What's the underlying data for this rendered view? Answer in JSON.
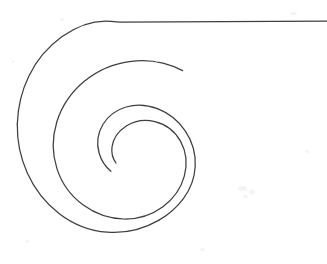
{
  "document": {
    "title": "Spiral Drawing",
    "medium": "scanned line drawing",
    "background_color": "#ffffff",
    "ink_color": "#3f3f42",
    "stroke_width": 1.25,
    "width": 327,
    "height": 264
  },
  "figure": {
    "name": "spiral-with-tangent-tail",
    "shape_type": "spiral",
    "turns": 1.55,
    "winding": "counterclockwise-inward",
    "pole": {
      "x": 147,
      "y": 140
    },
    "inner_terminus": {
      "x": 116,
      "y": 163
    },
    "outer_terminus": {
      "x": 327,
      "y": 21
    },
    "bounds": {
      "left": 17,
      "right": 327,
      "top": 21,
      "bottom": 246
    },
    "extremes": {
      "leftmost": {
        "x": 17,
        "y": 125
      },
      "bottommost": {
        "x": 105,
        "y": 246
      },
      "rightmost_whorl": {
        "x": 190,
        "y": 175
      },
      "inner_apex": {
        "x": 140,
        "y": 108
      }
    },
    "tail": {
      "name": "horizontal-tail",
      "description": "spiral unwinds into a near-horizontal straight line toward the right edge",
      "flatten_point": {
        "x": 120,
        "y": 22
      },
      "end_point": {
        "x": 327,
        "y": 21
      }
    },
    "spiral_path": "M 116.0 163.0 C 112.6 158.3 111.2 152.8 112.0 147.0 C 113.2 138.4 118.6 130.9 126.3 126.0 C 134.6 120.7 145.1 119.2 154.9 121.6 C 165.8 124.3 175.2 131.6 180.6 141.4 C 186.4 151.9 187.4 164.6 184.3 176.1 C 181.0 188.5 173.0 199.3 162.6 206.9 C 151.5 215.0 137.8 219.2 124.0 219.0 C 109.4 218.8 95.0 213.7 83.3 205.1 C 71.0 196.1 61.7 183.3 57.0 168.9 C 52.1 153.8 52.1 137.2 56.8 122.0 C 61.7 106.2 71.5 91.9 84.3 81.3 C 97.6 70.3 114.1 63.3 131.2 61.3 C 148.8 59.2 166.9 62.4 182.6 70.6",
    "spiral_path_outer": "M 182.6 70.6 C 166.9 62.4 148.8 59.2 131.2 61.3 C 114.1 63.3 97.6 70.3 84.3 81.3 C 71.5 91.9 61.7 106.2 56.8 122.0 C 52.1 137.2 52.1 153.8 57.0 168.9",
    "arc_outer_path": "M 17.3 124.0 C 17.0 140.8 20.4 157.7 27.3 173.0 C 34.4 188.8 45.3 202.9 59.0 213.4 C 72.9 224.1 89.8 230.9 107.2 232.2 C 124.9 233.6 143.0 229.3 158.6 220.4",
    "tail_path": "M 17.3 124.0 C 17.8 107.5 21.6 91.0 28.8 76.2 C 36.4 60.5 47.9 46.8 62.1 36.6 C 76.4 26.4 93.4 19.7 111.0 21.3 C 114.2 21.6 117.2 21.9 120.0 22.2 L 327 21.0"
  },
  "annotations": []
}
